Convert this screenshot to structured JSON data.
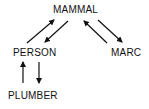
{
  "diagram": {
    "nodes": [
      {
        "id": "mammal",
        "label": "MAMMAL"
      },
      {
        "id": "person",
        "label": "PERSON"
      },
      {
        "id": "marc",
        "label": "MARC"
      },
      {
        "id": "plumber",
        "label": "PLUMBER"
      }
    ],
    "edges": [
      {
        "from": "person",
        "to": "mammal"
      },
      {
        "from": "mammal",
        "to": "person"
      },
      {
        "from": "marc",
        "to": "mammal"
      },
      {
        "from": "mammal",
        "to": "marc"
      },
      {
        "from": "plumber",
        "to": "person"
      },
      {
        "from": "person",
        "to": "plumber"
      }
    ]
  }
}
